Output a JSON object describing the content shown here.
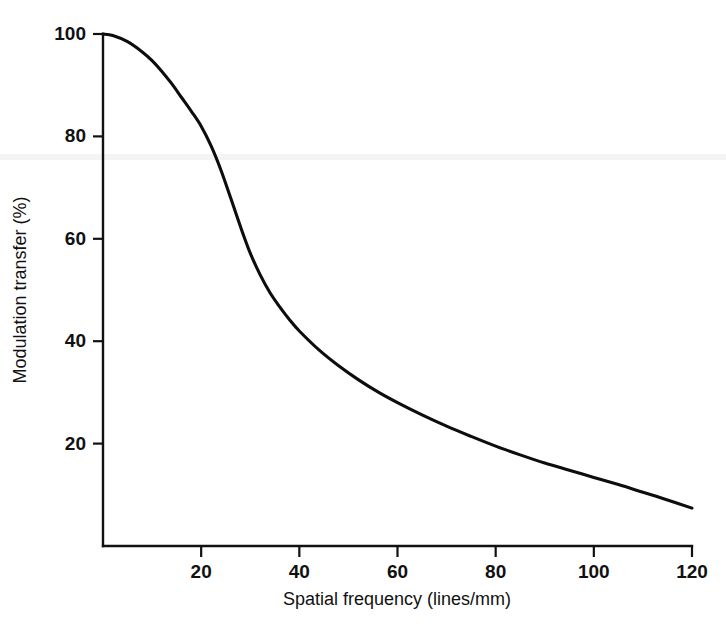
{
  "chart_data": {
    "type": "line",
    "title": "",
    "subtitle": "",
    "xlabel": "Spatial frequency (lines/mm)",
    "ylabel": "Modulation transfer (%)",
    "xlim": [
      0,
      120
    ],
    "ylim": [
      0,
      100
    ],
    "grid": false,
    "legend": null,
    "legend_position": "none",
    "xticks": [
      20,
      40,
      60,
      80,
      100,
      120
    ],
    "xtick_labels": [
      "20",
      "40",
      "60",
      "80",
      "100",
      "120"
    ],
    "yticks": [
      20,
      40,
      60,
      80,
      100
    ],
    "ytick_labels": [
      "20",
      "40",
      "60",
      "80",
      "100"
    ],
    "series": [
      {
        "name": "Modulation transfer function",
        "color": "#0d0d0d",
        "x": [
          0,
          2,
          5,
          8,
          10,
          12,
          14,
          16,
          18,
          20,
          22,
          24,
          26,
          28,
          30,
          32,
          34,
          36,
          38,
          40,
          44,
          48,
          52,
          56,
          60,
          65,
          70,
          75,
          80,
          85,
          90,
          95,
          100,
          105,
          110,
          115,
          120
        ],
        "values": [
          100,
          99.7,
          98.5,
          96.5,
          94.8,
          92.7,
          90.3,
          87.6,
          84.9,
          82.0,
          78.2,
          73.5,
          68.0,
          62.4,
          57.2,
          53.0,
          49.5,
          46.7,
          44.2,
          42.0,
          38.3,
          35.2,
          32.5,
          30.1,
          28.0,
          25.6,
          23.4,
          21.4,
          19.5,
          17.8,
          16.2,
          14.8,
          13.4,
          12.0,
          10.5,
          9.0,
          7.4
        ]
      }
    ],
    "annotations": []
  },
  "axes": {
    "y_axis_title": "Modulation transfer (%)",
    "x_axis_title": "Spatial frequency (lines/mm)"
  }
}
